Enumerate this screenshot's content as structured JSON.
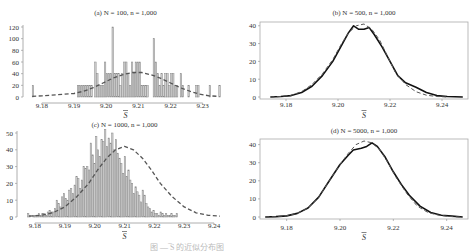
{
  "figure": {
    "caption": "图 — ̅S 的近似分布图"
  },
  "chart_data": [
    {
      "panel": "a",
      "type": "bar",
      "title": "(a) N = 100, n = 1,000",
      "xlabel": "S̄",
      "ylabel": "",
      "xlim": [
        9.176,
        9.236
      ],
      "ylim": [
        0,
        120
      ],
      "xticks": [
        9.18,
        9.19,
        9.2,
        9.21,
        9.22,
        9.23
      ],
      "xtick_labels": [
        "9.18",
        "9.19",
        "9.20",
        "9.21",
        "9.22",
        "9.23"
      ],
      "yticks": [
        0,
        20,
        40,
        60,
        80,
        100,
        120
      ],
      "ytick_labels": [
        "0",
        "20",
        "40",
        "60",
        "80",
        "100",
        "120"
      ],
      "frame": "left-bottom",
      "histogram": {
        "bin_width": 0.0006,
        "bins": [
          {
            "x": 9.177,
            "y": 20
          },
          {
            "x": 9.191,
            "y": 20
          },
          {
            "x": 9.1916,
            "y": 20
          },
          {
            "x": 9.1922,
            "y": 20
          },
          {
            "x": 9.1928,
            "y": 20
          },
          {
            "x": 9.1934,
            "y": 20
          },
          {
            "x": 9.194,
            "y": 20
          },
          {
            "x": 9.1946,
            "y": 20
          },
          {
            "x": 9.1952,
            "y": 20
          },
          {
            "x": 9.1964,
            "y": 60
          },
          {
            "x": 9.197,
            "y": 40
          },
          {
            "x": 9.1976,
            "y": 20
          },
          {
            "x": 9.1982,
            "y": 20
          },
          {
            "x": 9.1988,
            "y": 20
          },
          {
            "x": 9.1994,
            "y": 60
          },
          {
            "x": 9.2,
            "y": 40
          },
          {
            "x": 9.2006,
            "y": 40
          },
          {
            "x": 9.2012,
            "y": 40
          },
          {
            "x": 9.2018,
            "y": 120
          },
          {
            "x": 9.2024,
            "y": 40
          },
          {
            "x": 9.203,
            "y": 40
          },
          {
            "x": 9.2036,
            "y": 40
          },
          {
            "x": 9.2042,
            "y": 20
          },
          {
            "x": 9.2048,
            "y": 40
          },
          {
            "x": 9.2054,
            "y": 60
          },
          {
            "x": 9.206,
            "y": 60
          },
          {
            "x": 9.2066,
            "y": 40
          },
          {
            "x": 9.2072,
            "y": 20
          },
          {
            "x": 9.2078,
            "y": 60
          },
          {
            "x": 9.2084,
            "y": 40
          },
          {
            "x": 9.209,
            "y": 60
          },
          {
            "x": 9.2096,
            "y": 60
          },
          {
            "x": 9.2102,
            "y": 60
          },
          {
            "x": 9.2108,
            "y": 20
          },
          {
            "x": 9.2114,
            "y": 20
          },
          {
            "x": 9.212,
            "y": 20
          },
          {
            "x": 9.2126,
            "y": 20
          },
          {
            "x": 9.2146,
            "y": 100
          },
          {
            "x": 9.2152,
            "y": 60
          },
          {
            "x": 9.2158,
            "y": 40
          },
          {
            "x": 9.2164,
            "y": 20
          },
          {
            "x": 9.217,
            "y": 40
          },
          {
            "x": 9.2176,
            "y": 20
          },
          {
            "x": 9.2182,
            "y": 40
          },
          {
            "x": 9.2188,
            "y": 40
          },
          {
            "x": 9.2194,
            "y": 20
          },
          {
            "x": 9.22,
            "y": 40
          },
          {
            "x": 9.2206,
            "y": 40
          },
          {
            "x": 9.2212,
            "y": 20
          },
          {
            "x": 9.2218,
            "y": 20
          },
          {
            "x": 9.223,
            "y": 40
          },
          {
            "x": 9.2236,
            "y": 20
          },
          {
            "x": 9.2254,
            "y": 20
          },
          {
            "x": 9.2278,
            "y": 20
          },
          {
            "x": 9.2284,
            "y": 20
          },
          {
            "x": 9.232,
            "y": 20
          },
          {
            "x": 9.235,
            "y": 20
          }
        ]
      },
      "series": [
        {
          "name": "normal-fit",
          "style": "dashed",
          "x": [
            9.177,
            9.18,
            9.185,
            9.19,
            9.193,
            9.196,
            9.199,
            9.202,
            9.205,
            9.208,
            9.211,
            9.214,
            9.217,
            9.22,
            9.223,
            9.226,
            9.229,
            9.232,
            9.235
          ],
          "y": [
            1,
            2,
            4,
            6,
            10,
            16,
            24,
            32,
            38,
            42,
            42,
            38,
            32,
            24,
            16,
            10,
            5,
            2,
            1
          ]
        }
      ]
    },
    {
      "panel": "b",
      "type": "line",
      "title": "(b) N = 500, n = 1,000",
      "xlabel": "S̄",
      "ylabel": "",
      "xlim": [
        9.17,
        9.25
      ],
      "ylim": [
        0,
        41
      ],
      "xticks": [
        9.18,
        9.2,
        9.22,
        9.24
      ],
      "xtick_labels": [
        "9.18",
        "9.20",
        "9.22",
        "9.24"
      ],
      "yticks": [
        0,
        10,
        20,
        30,
        40
      ],
      "ytick_labels": [
        "0",
        "10",
        "20",
        "30",
        "40"
      ],
      "frame": "box",
      "series": [
        {
          "name": "empirical-density",
          "style": "solid",
          "x": [
            9.174,
            9.178,
            9.182,
            9.186,
            9.19,
            9.194,
            9.198,
            9.201,
            9.204,
            9.206,
            9.208,
            9.21,
            9.212,
            9.214,
            9.217,
            9.22,
            9.223,
            9.226,
            9.23,
            9.234,
            9.238,
            9.242,
            9.248
          ],
          "y": [
            0,
            0.3,
            0.8,
            2.5,
            6,
            12,
            20,
            28,
            36,
            40,
            38,
            38,
            39,
            35,
            28,
            20,
            12,
            8,
            5.5,
            2.5,
            0.8,
            0.3,
            0
          ]
        },
        {
          "name": "normal-fit",
          "style": "dashed",
          "x": [
            9.174,
            9.178,
            9.182,
            9.186,
            9.19,
            9.194,
            9.198,
            9.201,
            9.204,
            9.207,
            9.21,
            9.213,
            9.216,
            9.219,
            9.222,
            9.226,
            9.23,
            9.234,
            9.238,
            9.242
          ],
          "y": [
            0,
            0.3,
            1,
            3,
            7,
            13,
            21,
            29,
            36,
            40,
            41,
            38,
            32,
            23,
            14,
            7,
            3,
            1,
            0.3,
            0
          ]
        }
      ]
    },
    {
      "panel": "c",
      "type": "bar",
      "title": "(c) N = 1000, n = 1,000",
      "xlabel": "S̄",
      "ylabel": "",
      "xlim": [
        9.176,
        9.244
      ],
      "ylim": [
        0,
        50
      ],
      "xticks": [
        9.18,
        9.19,
        9.2,
        9.21,
        9.22,
        9.23,
        9.24
      ],
      "xtick_labels": [
        "9.18",
        "9.19",
        "9.20",
        "9.21",
        "9.22",
        "9.23",
        "9.24"
      ],
      "yticks": [
        0,
        10,
        20,
        30,
        40,
        50
      ],
      "ytick_labels": [
        "0",
        "10",
        "20",
        "30",
        "40",
        "50"
      ],
      "frame": "left-bottom",
      "histogram": {
        "bin_width": 0.0006,
        "heights": [
          2,
          1,
          0,
          1,
          1,
          1,
          2,
          1,
          2,
          2,
          1,
          3,
          4,
          3,
          3,
          5,
          10,
          8,
          6,
          12,
          14,
          11,
          10,
          16,
          17,
          14,
          19,
          24,
          23,
          17,
          22,
          30,
          29,
          30,
          28,
          44,
          37,
          32,
          48,
          40,
          36,
          46,
          45,
          52,
          42,
          47,
          44,
          50,
          40,
          46,
          38,
          35,
          32,
          26,
          36,
          24,
          28,
          22,
          20,
          14,
          18,
          15,
          13,
          9,
          16,
          13,
          8,
          6,
          5,
          3,
          4,
          2,
          2,
          1,
          3,
          2,
          1,
          2,
          1,
          1,
          2,
          1,
          1,
          2
        ],
        "x_start": 9.1775
      },
      "series": [
        {
          "name": "normal-fit",
          "style": "dashed",
          "x": [
            9.178,
            9.182,
            9.186,
            9.19,
            9.194,
            9.198,
            9.201,
            9.204,
            9.207,
            9.21,
            9.213,
            9.216,
            9.219,
            9.222,
            9.226,
            9.23,
            9.234,
            9.238,
            9.242
          ],
          "y": [
            0.5,
            1,
            2.5,
            6,
            12,
            20,
            28,
            35,
            40,
            42,
            40,
            35,
            28,
            20,
            12,
            6,
            2.5,
            1,
            0.5
          ]
        }
      ]
    },
    {
      "panel": "d",
      "type": "line",
      "title": "(d) N = 5000, n = 1,000",
      "xlabel": "S̄",
      "ylabel": "",
      "xlim": [
        9.17,
        9.248
      ],
      "ylim": [
        0,
        42
      ],
      "xticks": [
        9.18,
        9.2,
        9.22,
        9.24
      ],
      "xtick_labels": [
        "9.18",
        "9.20",
        "9.22",
        "9.24"
      ],
      "yticks": [
        0,
        10,
        20,
        30,
        40
      ],
      "ytick_labels": [
        "0",
        "10",
        "20",
        "30",
        "40"
      ],
      "frame": "box",
      "series": [
        {
          "name": "empirical-density",
          "style": "solid",
          "x": [
            9.172,
            9.176,
            9.18,
            9.184,
            9.188,
            9.192,
            9.196,
            9.2,
            9.203,
            9.205,
            9.208,
            9.21,
            9.212,
            9.214,
            9.217,
            9.22,
            9.223,
            9.226,
            9.23,
            9.234,
            9.238,
            9.242,
            9.246
          ],
          "y": [
            0,
            0.2,
            0.6,
            2,
            5,
            11,
            20,
            29,
            34,
            37,
            38,
            39,
            41,
            39,
            33,
            25,
            18,
            12,
            6,
            2.5,
            1,
            0.5,
            0
          ]
        },
        {
          "name": "normal-fit",
          "style": "dashed",
          "x": [
            9.172,
            9.176,
            9.18,
            9.184,
            9.188,
            9.192,
            9.196,
            9.2,
            9.203,
            9.206,
            9.209,
            9.212,
            9.215,
            9.218,
            9.221,
            9.225,
            9.229,
            9.233,
            9.237,
            9.241,
            9.245
          ],
          "y": [
            0,
            0.2,
            0.7,
            2,
            5,
            11,
            20,
            29,
            35,
            40,
            42,
            41,
            37,
            30,
            22,
            13,
            6,
            2.5,
            1,
            0.3,
            0
          ]
        }
      ]
    }
  ]
}
